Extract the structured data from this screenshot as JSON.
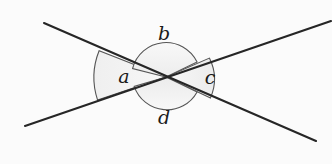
{
  "figure": {
    "name": "intersecting-lines-angles-diagram",
    "background_color": "#fbfbfb",
    "line_color": "#262626",
    "sector_fill_light": "#f4f4f4",
    "sector_fill_shade": "#e8e8e8",
    "arc_stroke_color": "#4d4d4d",
    "intersection": {
      "x": 166,
      "y": 77
    },
    "lines": [
      {
        "name": "line-upper-left-to-lower-right",
        "from": {
          "x": 44,
          "y": 23
        },
        "to": {
          "x": 316,
          "y": 141
        }
      },
      {
        "name": "line-lower-left-to-upper-right",
        "from": {
          "x": 25,
          "y": 126
        },
        "to": {
          "x": 331,
          "y": 21
        }
      }
    ],
    "labels": [
      {
        "id": "a",
        "text": "a",
        "x": 124,
        "y": 78
      },
      {
        "id": "b",
        "text": "b",
        "x": 164,
        "y": 35
      },
      {
        "id": "c",
        "text": "c",
        "x": 210,
        "y": 79
      },
      {
        "id": "d",
        "text": "d",
        "x": 164,
        "y": 119
      }
    ],
    "sectors": [
      {
        "id": "a",
        "name": "angle-sector-a",
        "radius": 68,
        "position": "left"
      },
      {
        "id": "b",
        "name": "angle-sector-b",
        "radius": 33,
        "position": "top"
      },
      {
        "id": "c",
        "name": "angle-sector-c",
        "radius": 44,
        "position": "right"
      },
      {
        "id": "d",
        "name": "angle-sector-d",
        "radius": 33,
        "position": "bottom"
      }
    ]
  }
}
